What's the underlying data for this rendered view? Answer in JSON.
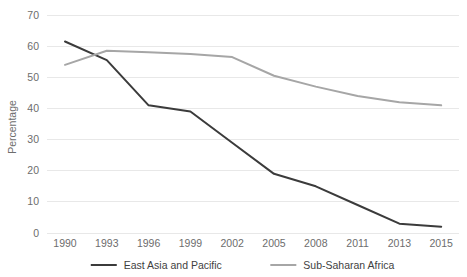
{
  "chart_data": {
    "type": "line",
    "title": "",
    "xlabel": "",
    "ylabel": "Percentage",
    "categories": [
      "1990",
      "1993",
      "1996",
      "1999",
      "2002",
      "2005",
      "2008",
      "2011",
      "2013",
      "2015"
    ],
    "x_tick_labels": [
      "1990",
      "1993",
      "1996",
      "1999",
      "2002",
      "2005",
      "2008",
      "2011",
      "2013",
      "2015"
    ],
    "y_tick_labels": [
      "0",
      "10",
      "20",
      "30",
      "40",
      "50",
      "60",
      "70"
    ],
    "y_ticks": [
      0,
      10,
      20,
      30,
      40,
      50,
      60,
      70
    ],
    "ylim": [
      0,
      70
    ],
    "grid": "horizontal",
    "legend_position": "bottom",
    "series": [
      {
        "name": "East Asia and Pacific",
        "color": "#3b3b3b",
        "values": [
          61.5,
          55.5,
          41,
          39,
          29,
          19,
          15,
          9,
          3,
          2
        ]
      },
      {
        "name": "Sub-Saharan Africa",
        "color": "#a6a6a6",
        "values": [
          54,
          58.5,
          58,
          57.5,
          56.5,
          50.5,
          47,
          44,
          42,
          41
        ]
      }
    ]
  },
  "axis": {
    "y_title": "Percentage"
  },
  "legend": {
    "items": [
      {
        "label": "East Asia and Pacific"
      },
      {
        "label": "Sub-Saharan Africa"
      }
    ]
  },
  "colors": {
    "series_1": "#3b3b3b",
    "series_2": "#a6a6a6",
    "gridline": "#e8e8e8",
    "tick_text": "#6d6d6d",
    "legend_text": "#3f3f3f",
    "background": "#ffffff"
  }
}
